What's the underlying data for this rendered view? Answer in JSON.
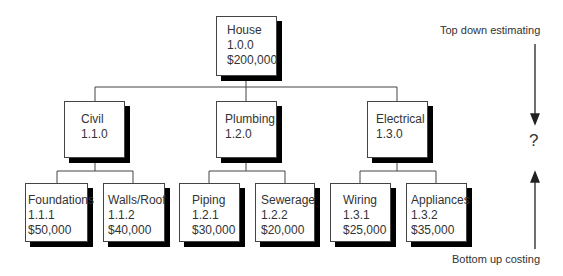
{
  "nodes": {
    "house": {
      "name": "House",
      "code": "1.0.0",
      "cost": "$200,000"
    },
    "civil": {
      "name": "Civil",
      "code": "1.1.0"
    },
    "plumbing": {
      "name": "Plumbing",
      "code": "1.2.0"
    },
    "electrical": {
      "name": "Electrical",
      "code": "1.3.0"
    },
    "foundations": {
      "name": "Foundations",
      "code": "1.1.1",
      "cost": "$50,000"
    },
    "walls_roof": {
      "name": "Walls/Roof",
      "code": "1.1.2",
      "cost": "$40,000"
    },
    "piping": {
      "name": "Piping",
      "code": "1.2.1",
      "cost": "$30,000"
    },
    "sewerage": {
      "name": "Sewerage",
      "code": "1.2.2",
      "cost": "$20,000"
    },
    "wiring": {
      "name": "Wiring",
      "code": "1.3.1",
      "cost": "$25,000"
    },
    "appliances": {
      "name": "Appliances",
      "code": "1.3.2",
      "cost": "$35,000"
    }
  },
  "annotations": {
    "top_down": "Top down estimating",
    "bottom_up": "Bottom up costing",
    "question": "?"
  }
}
